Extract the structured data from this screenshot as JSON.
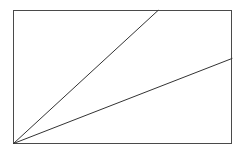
{
  "canvas": {
    "width": 245,
    "height": 158,
    "background_color": "#ffffff"
  },
  "figure": {
    "name": "rectangle-with-two-diagonal-rays",
    "stroke_color": "#4a4a4a",
    "ray_stroke_color": "#333333",
    "fill_color": "#ffffff",
    "stroke_width": 1,
    "rectangle": {
      "x": 13,
      "y": 10,
      "width": 219,
      "height": 134,
      "left": 13,
      "top": 10,
      "right": 232,
      "bottom": 144
    },
    "apex": {
      "x": 13,
      "y": 144
    },
    "rays": [
      {
        "name": "steep-ray",
        "x1": 13,
        "y1": 144,
        "x2": 158,
        "y2": 10,
        "ends_on": "top-edge"
      },
      {
        "name": "shallow-ray",
        "x1": 13,
        "y1": 144,
        "x2": 232,
        "y2": 58,
        "ends_on": "right-edge"
      }
    ]
  }
}
